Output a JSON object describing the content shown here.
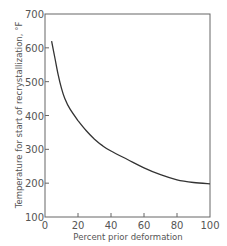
{
  "chart_data": {
    "type": "line",
    "title": "",
    "xlabel": "Percent prior deformation",
    "ylabel": "Temperature for start of recrystallization, °F",
    "xlim": [
      0,
      100
    ],
    "ylim": [
      100,
      700
    ],
    "xticks": [
      0,
      20,
      40,
      60,
      80,
      100
    ],
    "yticks": [
      100,
      200,
      300,
      400,
      500,
      600,
      700
    ],
    "grid": false,
    "legend": null,
    "series": [
      {
        "name": "Recrystallization temperature",
        "x": [
          4,
          6,
          8,
          10,
          12,
          15,
          20,
          25,
          30,
          35,
          40,
          50,
          60,
          70,
          80,
          90,
          100
        ],
        "y": [
          620,
          570,
          520,
          480,
          450,
          420,
          385,
          355,
          330,
          310,
          295,
          270,
          245,
          225,
          210,
          202,
          198
        ]
      }
    ]
  },
  "colors": {
    "frame": "#666666",
    "curve": "#333333",
    "text": "#555555"
  }
}
